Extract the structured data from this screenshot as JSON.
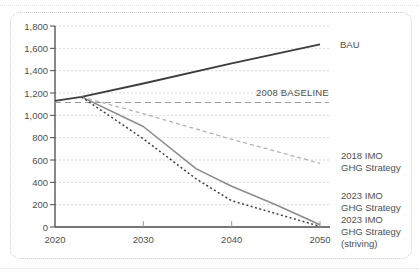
{
  "labels": {
    "bau": "BAU",
    "baseline": "2008 BASELINE",
    "s2018": "2018 IMO\nGHG Strategy",
    "s2023": "2023 IMO\nGHG Strategy",
    "s2023_striving": "2023 IMO\nGHG Strategy\n(striving)"
  },
  "colors": {
    "dark_line": "#3d3d3d",
    "mid_gray_line": "#8c8c8c",
    "baseline_gray": "#9a9a9a",
    "light_gray_line": "#b3b3b3",
    "grid": "#d9d9d9",
    "axis": "#4a4a4a",
    "tick_text": "#4f4f4f",
    "card_border": "#c9c9c9"
  },
  "chart_data": {
    "type": "line",
    "title": "",
    "xlabel": "",
    "ylabel": "",
    "x_range": [
      2020,
      2050
    ],
    "y_range": [
      0,
      1800
    ],
    "grid": "horizontal dashed",
    "legend_position": "right-side text labels",
    "x_ticks": [
      {
        "value": 2020,
        "label": "2020"
      },
      {
        "value": 2030,
        "label": "2030"
      },
      {
        "value": 2040,
        "label": "2040"
      },
      {
        "value": 2050,
        "label": "2050"
      }
    ],
    "y_ticks": [
      {
        "value": 0,
        "label": "0"
      },
      {
        "value": 200,
        "label": "200"
      },
      {
        "value": 400,
        "label": "400"
      },
      {
        "value": 600,
        "label": "600"
      },
      {
        "value": 800,
        "label": "800"
      },
      {
        "value": 1000,
        "label": "1,000"
      },
      {
        "value": 1200,
        "label": "1,200"
      },
      {
        "value": 1400,
        "label": "1,400"
      },
      {
        "value": 1600,
        "label": "1,600"
      },
      {
        "value": 1800,
        "label": "1,800"
      }
    ],
    "series": [
      {
        "name": "BAU",
        "style": "solid",
        "color": "#3d3d3d",
        "width": 1.8,
        "points": [
          [
            2020,
            1130
          ],
          [
            2023,
            1165
          ],
          [
            2030,
            1285
          ],
          [
            2040,
            1465
          ],
          [
            2050,
            1635
          ]
        ]
      },
      {
        "name": "2008 BASELINE",
        "style": "dashed",
        "color": "#9a9a9a",
        "width": 1.1,
        "points": [
          [
            2020,
            1115
          ],
          [
            2051,
            1115
          ]
        ]
      },
      {
        "name": "2018 IMO GHG Strategy",
        "style": "dashed-short",
        "color": "#b3b3b3",
        "width": 1.3,
        "points": [
          [
            2023,
            1165
          ],
          [
            2030,
            1015
          ],
          [
            2040,
            785
          ],
          [
            2050,
            570
          ]
        ]
      },
      {
        "name": "2023 IMO GHG Strategy",
        "style": "solid",
        "color": "#8c8c8c",
        "width": 1.6,
        "points": [
          [
            2023,
            1165
          ],
          [
            2030,
            900
          ],
          [
            2036,
            520
          ],
          [
            2040,
            365
          ],
          [
            2045,
            200
          ],
          [
            2050,
            20
          ]
        ]
      },
      {
        "name": "2023 IMO GHG Strategy (striving)",
        "style": "dotted",
        "color": "#3d3d3d",
        "width": 1.5,
        "points": [
          [
            2023,
            1165
          ],
          [
            2030,
            790
          ],
          [
            2036,
            430
          ],
          [
            2040,
            235
          ],
          [
            2045,
            120
          ],
          [
            2050,
            5
          ]
        ]
      }
    ]
  }
}
